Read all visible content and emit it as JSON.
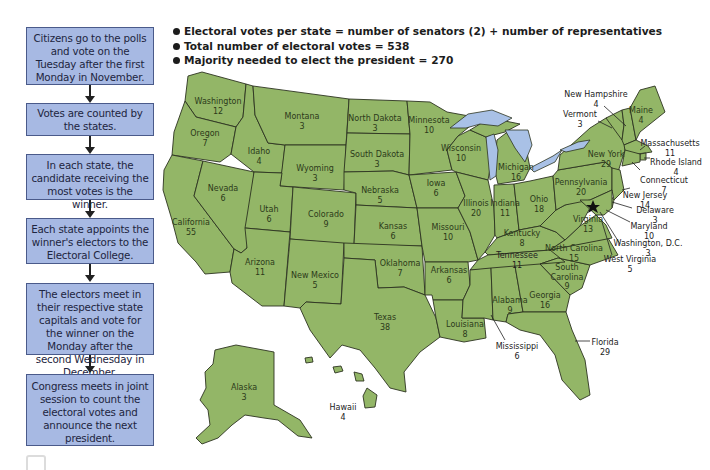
{
  "flowchart": {
    "steps": [
      "Citizens go to the polls and vote on the Tuesday after the first Monday in November.",
      "Votes are counted by the states.",
      "In each state, the candidate receiving the most votes is the winner.",
      "Each state appoints the winner's electors to the Electoral College.",
      "The electors meet in their respective state capitals and vote for the winner on the Monday after the second Wednesday in December.",
      "Congress meets in joint session to count the electoral votes and announce the next president."
    ]
  },
  "facts": [
    "Electoral votes per state = number of senators (2) + number of representatives",
    "Total number of electoral votes = 538",
    "Majority needed to elect the president = 270"
  ],
  "colors": {
    "state_fill": "#93b667",
    "state_border": "#2c3320",
    "lake_fill": "#a9c1e6",
    "step_fill": "#a7b9e3",
    "step_border": "#4a5a8a"
  },
  "states": [
    {
      "name": "Washington",
      "votes": "12"
    },
    {
      "name": "Oregon",
      "votes": "7"
    },
    {
      "name": "California",
      "votes": "55"
    },
    {
      "name": "Nevada",
      "votes": "6"
    },
    {
      "name": "Idaho",
      "votes": "4"
    },
    {
      "name": "Montana",
      "votes": "3"
    },
    {
      "name": "Wyoming",
      "votes": "3"
    },
    {
      "name": "Utah",
      "votes": "6"
    },
    {
      "name": "Colorado",
      "votes": "9"
    },
    {
      "name": "Arizona",
      "votes": "11"
    },
    {
      "name": "New Mexico",
      "votes": "5"
    },
    {
      "name": "North Dakota",
      "votes": "3"
    },
    {
      "name": "South Dakota",
      "votes": "3"
    },
    {
      "name": "Nebraska",
      "votes": "5"
    },
    {
      "name": "Kansas",
      "votes": "6"
    },
    {
      "name": "Oklahoma",
      "votes": "7"
    },
    {
      "name": "Texas",
      "votes": "38"
    },
    {
      "name": "Minnesota",
      "votes": "10"
    },
    {
      "name": "Iowa",
      "votes": "6"
    },
    {
      "name": "Missouri",
      "votes": "10"
    },
    {
      "name": "Arkansas",
      "votes": "6"
    },
    {
      "name": "Louisiana",
      "votes": "8"
    },
    {
      "name": "Wisconsin",
      "votes": "10"
    },
    {
      "name": "Illinois",
      "votes": "20"
    },
    {
      "name": "Michigan",
      "votes": "16"
    },
    {
      "name": "Indiana",
      "votes": "11"
    },
    {
      "name": "Ohio",
      "votes": "18"
    },
    {
      "name": "Kentucky",
      "votes": "8"
    },
    {
      "name": "Tennessee",
      "votes": "11"
    },
    {
      "name": "Mississippi",
      "votes": "6"
    },
    {
      "name": "Alabama",
      "votes": "9"
    },
    {
      "name": "Georgia",
      "votes": "16"
    },
    {
      "name": "Florida",
      "votes": "29"
    },
    {
      "name": "South Carolina",
      "votes": "9"
    },
    {
      "name": "North Carolina",
      "votes": "15"
    },
    {
      "name": "Virginia",
      "votes": "13"
    },
    {
      "name": "West Virginia",
      "votes": "5"
    },
    {
      "name": "Pennsylvania",
      "votes": "20"
    },
    {
      "name": "New York",
      "votes": "29"
    },
    {
      "name": "Vermont",
      "votes": "3"
    },
    {
      "name": "New Hampshire",
      "votes": "4"
    },
    {
      "name": "Maine",
      "votes": "4"
    },
    {
      "name": "Massachusetts",
      "votes": "11"
    },
    {
      "name": "Rhode Island",
      "votes": "4"
    },
    {
      "name": "Connecticut",
      "votes": "7"
    },
    {
      "name": "New Jersey",
      "votes": "14"
    },
    {
      "name": "Delaware",
      "votes": "3"
    },
    {
      "name": "Maryland",
      "votes": "10"
    },
    {
      "name": "Washington, D.C.",
      "votes": "3"
    },
    {
      "name": "Alaska",
      "votes": "3"
    },
    {
      "name": "Hawaii",
      "votes": "4"
    }
  ]
}
